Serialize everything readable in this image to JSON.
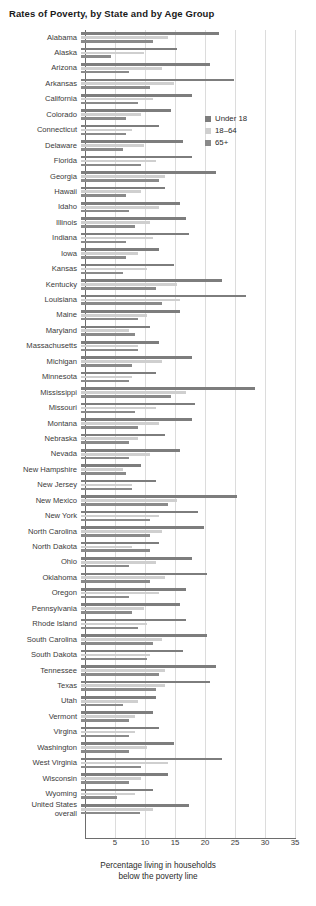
{
  "chart_data": {
    "type": "bar",
    "orientation": "horizontal",
    "title": "Rates of Poverty, by State and by Age Group",
    "xlabel_lines": [
      "Percentage living in households",
      "below the poverty line"
    ],
    "ylabel": "",
    "xlim": [
      0,
      35
    ],
    "xticks": [
      5,
      10,
      15,
      20,
      25,
      30,
      35
    ],
    "grid": "vertical",
    "legend_position": "upper-right-inside",
    "legend": [
      "Under 18",
      "18–64",
      "65+"
    ],
    "series_colors": {
      "Under 18": "#7d7d7d",
      "18–64": "#cfcfcf",
      "65+": "#8a8a8a"
    },
    "categories": [
      "Alabama",
      "Alaska",
      "Arizona",
      "Arkansas",
      "California",
      "Colorado",
      "Connecticut",
      "Delaware",
      "Florida",
      "Georgia",
      "Hawaii",
      "Idaho",
      "Illinois",
      "Indiana",
      "Iowa",
      "Kansas",
      "Kentucky",
      "Louisiana",
      "Maine",
      "Maryland",
      "Massachusetts",
      "Michigan",
      "Minnesota",
      "Mississippi",
      "Missouri",
      "Montana",
      "Nebraska",
      "Nevada",
      "New Hampshire",
      "New Jersey",
      "New Mexico",
      "New York",
      "North Carolina",
      "North Dakota",
      "Ohio",
      "Oklahoma",
      "Oregon",
      "Pennsylvania",
      "Rhode Island",
      "South Carolina",
      "South Dakota",
      "Tennessee",
      "Texas",
      "Utah",
      "Vermont",
      "Virgina",
      "Washington",
      "West Virginia",
      "Wisconsin",
      "Wyoming",
      "United States\noverall"
    ],
    "series": [
      {
        "name": "Under 18",
        "values": [
          23.0,
          16.0,
          21.5,
          25.5,
          18.5,
          15.0,
          13.0,
          17.0,
          18.5,
          22.5,
          14.0,
          16.5,
          17.5,
          18.0,
          13.0,
          15.5,
          23.5,
          27.5,
          16.5,
          11.5,
          13.0,
          18.5,
          12.5,
          29.0,
          19.0,
          18.5,
          14.0,
          16.5,
          10.0,
          12.5,
          26.0,
          19.5,
          20.5,
          13.0,
          18.5,
          21.0,
          17.5,
          16.5,
          17.5,
          21.0,
          17.0,
          22.5,
          21.5,
          12.5,
          12.0,
          13.0,
          15.5,
          23.5,
          14.5,
          12.0,
          18.0
        ]
      },
      {
        "name": "18–64",
        "values": [
          14.5,
          10.5,
          13.5,
          15.5,
          12.0,
          10.0,
          8.5,
          10.5,
          12.5,
          14.0,
          10.0,
          13.0,
          11.5,
          12.0,
          9.5,
          11.0,
          16.0,
          16.5,
          11.0,
          8.0,
          9.5,
          13.5,
          8.5,
          17.5,
          12.5,
          13.0,
          9.5,
          11.5,
          7.0,
          8.5,
          16.0,
          13.0,
          13.5,
          8.5,
          12.5,
          14.0,
          13.0,
          10.5,
          11.0,
          13.5,
          11.5,
          14.0,
          14.0,
          9.5,
          9.0,
          9.0,
          11.0,
          14.5,
          10.0,
          9.0,
          12.0
        ]
      },
      {
        "name": "65+",
        "values": [
          12.0,
          5.0,
          8.0,
          11.5,
          9.5,
          7.5,
          7.5,
          7.0,
          10.0,
          13.0,
          7.5,
          8.0,
          9.0,
          7.5,
          7.5,
          7.0,
          12.5,
          13.5,
          9.5,
          9.0,
          9.5,
          8.5,
          8.0,
          15.0,
          9.0,
          9.5,
          8.0,
          8.0,
          7.5,
          8.5,
          14.5,
          11.5,
          11.5,
          11.5,
          8.0,
          11.5,
          8.0,
          8.5,
          9.5,
          12.0,
          11.0,
          13.0,
          12.5,
          7.0,
          8.0,
          8.0,
          8.0,
          10.0,
          8.0,
          6.0,
          9.8
        ]
      }
    ]
  }
}
